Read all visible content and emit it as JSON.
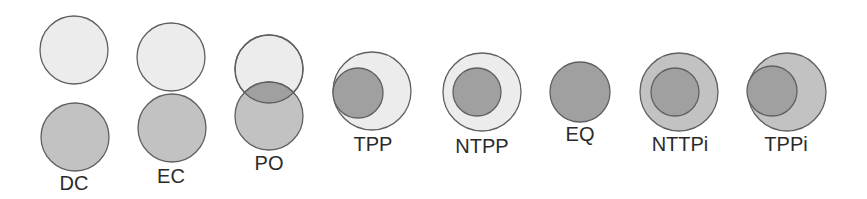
{
  "diagram": {
    "colors": {
      "background": "#ffffff",
      "light_fill": "#ececec",
      "medium_fill": "#c2c2c2",
      "dark_fill": "#a0a0a0",
      "stroke": "#606060"
    },
    "relations": [
      {
        "id": "dc",
        "label": "DC",
        "label_pos": [
          74,
          190
        ],
        "circles": [
          {
            "cx": 74,
            "cy": 50,
            "r": 34,
            "fill": "light_fill"
          },
          {
            "cx": 75,
            "cy": 137,
            "r": 34,
            "fill": "medium_fill"
          }
        ],
        "overlap": null
      },
      {
        "id": "ec",
        "label": "EC",
        "label_pos": [
          171,
          183
        ],
        "circles": [
          {
            "cx": 171,
            "cy": 57,
            "r": 34,
            "fill": "light_fill"
          },
          {
            "cx": 172,
            "cy": 128,
            "r": 34,
            "fill": "medium_fill"
          }
        ],
        "overlap": null
      },
      {
        "id": "po",
        "label": "PO",
        "label_pos": [
          269,
          170
        ],
        "circles": [
          {
            "cx": 269,
            "cy": 69,
            "r": 34,
            "fill": "light_fill"
          },
          {
            "cx": 269,
            "cy": 116,
            "r": 34,
            "fill": "medium_fill"
          }
        ],
        "overlap": {
          "a": 0,
          "b": 1,
          "fill": "dark_fill"
        }
      },
      {
        "id": "tpp",
        "label": "TPP",
        "label_pos": [
          373,
          151
        ],
        "circles": [
          {
            "cx": 372,
            "cy": 91,
            "r": 39,
            "fill": "light_fill"
          },
          {
            "cx": 358,
            "cy": 93,
            "r": 25,
            "fill": "dark_fill"
          }
        ],
        "overlap": null
      },
      {
        "id": "ntpp",
        "label": "NTPP",
        "label_pos": [
          482,
          153
        ],
        "circles": [
          {
            "cx": 482,
            "cy": 92,
            "r": 39,
            "fill": "light_fill"
          },
          {
            "cx": 477,
            "cy": 92,
            "r": 24,
            "fill": "dark_fill"
          }
        ],
        "overlap": null
      },
      {
        "id": "eq",
        "label": "EQ",
        "label_pos": [
          580,
          141
        ],
        "circles": [
          {
            "cx": 580,
            "cy": 92,
            "r": 30,
            "fill": "dark_fill"
          }
        ],
        "overlap": null
      },
      {
        "id": "nttpi",
        "label": "NTTPi",
        "label_pos": [
          680,
          151
        ],
        "circles": [
          {
            "cx": 679,
            "cy": 92,
            "r": 39,
            "fill": "medium_fill"
          },
          {
            "cx": 675,
            "cy": 92,
            "r": 24,
            "fill": "dark_fill"
          }
        ],
        "overlap": null
      },
      {
        "id": "tppi",
        "label": "TPPi",
        "label_pos": [
          786,
          151
        ],
        "circles": [
          {
            "cx": 787,
            "cy": 92,
            "r": 39,
            "fill": "medium_fill"
          },
          {
            "cx": 772,
            "cy": 91,
            "r": 25,
            "fill": "dark_fill"
          }
        ],
        "overlap": null
      }
    ]
  }
}
